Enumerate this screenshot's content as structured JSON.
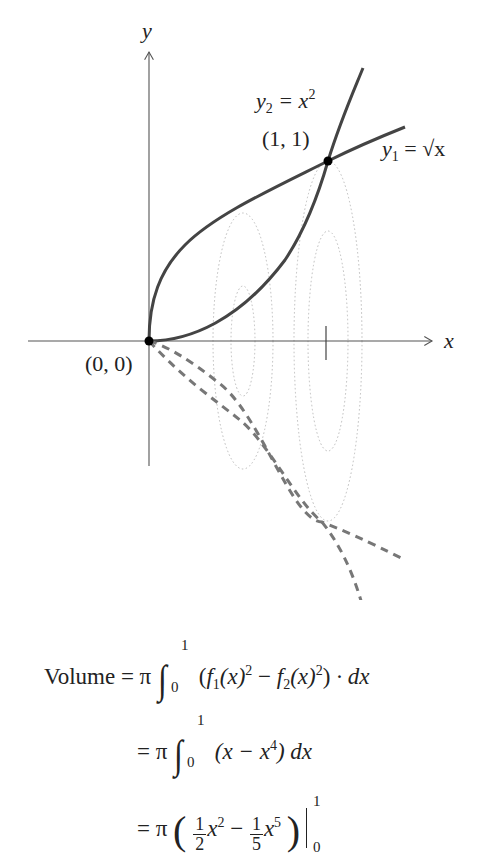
{
  "diagram": {
    "axes": {
      "x_label": "x",
      "y_label": "y",
      "origin_label": "(0, 0)",
      "tick_x": 1
    },
    "curves": [
      {
        "name": "y1",
        "label_var": "y",
        "label_sub": "1",
        "label_rhs": "= √x",
        "equation": "y1 = sqrt(x)",
        "style": "solid"
      },
      {
        "name": "y2",
        "label_var": "y",
        "label_sub": "2",
        "label_rhs": "= x",
        "label_sup": "2",
        "equation": "y2 = x^2",
        "style": "solid"
      }
    ],
    "reflections": {
      "style": "dashed",
      "description": "curves reflected below x-axis (solid of revolution)"
    },
    "cross_sections": {
      "style": "dotted",
      "shape": "ellipse"
    },
    "points": [
      {
        "label": "(0, 0)",
        "x": 0,
        "y": 0
      },
      {
        "label": "(1, 1)",
        "x": 1,
        "y": 1
      }
    ],
    "colors": {
      "curve": "#444444",
      "axis": "#555555",
      "dashed": "#777777",
      "dotted": "#bbbbbb",
      "point": "#000000"
    }
  },
  "equations": {
    "line1": {
      "lhs": "Volume",
      "eq": "= π",
      "upper": "1",
      "lower": "0",
      "body_open": "(",
      "f1": "f",
      "f1_sub": "1",
      "f1_arg": "(x)",
      "f1_sup": "2",
      "minus": " − ",
      "f2": "f",
      "f2_sub": "2",
      "f2_arg": "(x)",
      "f2_sup": "2",
      "body_close": ")",
      "dot": " · dx"
    },
    "line2": {
      "eq": "= π",
      "upper": "1",
      "lower": "0",
      "open": "(x − x",
      "sup": "4",
      "close": ") dx"
    },
    "line3": {
      "eq": "= π",
      "frac1_num": "1",
      "frac1_den": "2",
      "term1": "x",
      "term1_sup": "2",
      "minus": " − ",
      "frac2_num": "1",
      "frac2_den": "5",
      "term2": "x",
      "term2_sup": "5",
      "eval_upper": "1",
      "eval_lower": "0"
    }
  }
}
